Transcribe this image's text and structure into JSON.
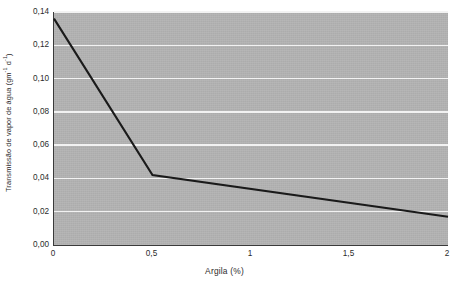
{
  "chart_data": {
    "type": "line",
    "title": "",
    "xlabel": "Argila (%)",
    "ylabel": "Transmissão de vapor de água (gm",
    "ylabel_sup1": "-1",
    "ylabel_mid": " d",
    "ylabel_sup2": "-1",
    "ylabel_end": ")",
    "ylabel_full": "Transmissão de vapor de água (gm-1 d-1)",
    "x": [
      0,
      0.5,
      2
    ],
    "values": [
      0.136,
      0.042,
      0.017
    ],
    "series": [
      {
        "name": "Transmissão de vapor de água",
        "x": [
          0,
          0.5,
          2
        ],
        "values": [
          0.136,
          0.042,
          0.017
        ]
      }
    ],
    "xlim": [
      0,
      2
    ],
    "ylim": [
      0,
      0.14
    ],
    "xticks": [
      0,
      0.5,
      1,
      1.5,
      2
    ],
    "xtick_labels": [
      "0",
      "0,5",
      "1",
      "1,5",
      "2"
    ],
    "yticks": [
      0,
      0.02,
      0.04,
      0.06,
      0.08,
      0.1,
      0.12,
      0.14
    ],
    "ytick_labels": [
      "0,00",
      "0,02",
      "0,04",
      "0,06",
      "0,08",
      "0,10",
      "0,12",
      "0,14"
    ],
    "grid": "horizontal",
    "grid_color": "#f2f2f2",
    "plot_background": "#b2b2b2",
    "line_color": "#1a1a1a",
    "axis_color": "#3a3a3a",
    "legend": "none"
  }
}
